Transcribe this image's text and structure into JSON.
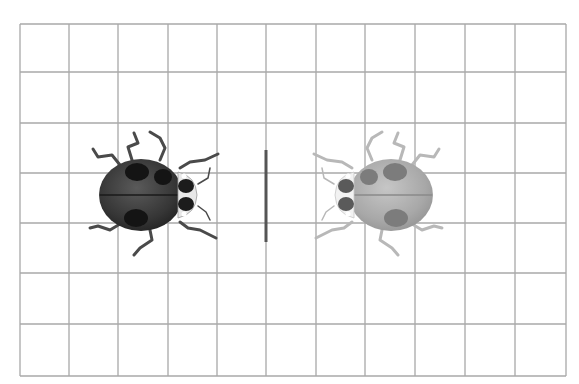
{
  "diagram": {
    "type": "mirror-reflection-grid",
    "grid": {
      "columns": 11,
      "rows": 7,
      "x_lines": [
        20,
        69,
        118,
        168,
        217,
        266,
        316,
        365,
        415,
        465,
        515,
        566
      ],
      "y_lines": [
        24,
        72,
        123,
        173,
        223,
        273,
        324,
        376
      ],
      "line_color": "#a8a8a8"
    },
    "mirror_line": {
      "x": 266,
      "y_start": 150,
      "y_end": 242,
      "color": "#555555",
      "width": 3
    },
    "objects": [
      {
        "name": "ladybug-original",
        "shade": "dark",
        "facing": "right",
        "center": [
          141,
          195
        ],
        "body_color": "#3a3a3a",
        "spot_color": "#151515",
        "leg_color": "#4a4a4a"
      },
      {
        "name": "ladybug-reflection",
        "shade": "light",
        "facing": "left",
        "center": [
          391,
          195
        ],
        "body_color": "#a9a9a9",
        "spot_color": "#7a7a7a",
        "leg_color": "#b8b8b8"
      }
    ]
  }
}
